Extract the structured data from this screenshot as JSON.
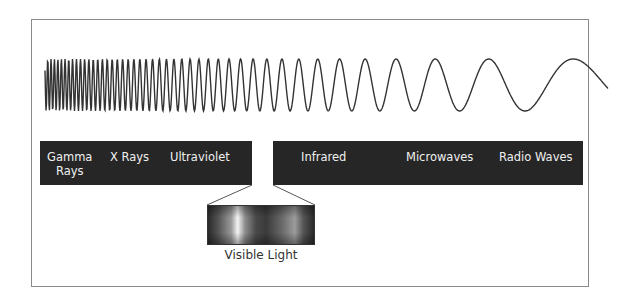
{
  "diagram": {
    "bands": [
      {
        "id": "gamma",
        "label_line1": "Gamma",
        "label_line2": "Rays"
      },
      {
        "id": "xray",
        "label": "X Rays"
      },
      {
        "id": "uv",
        "label": "Ultraviolet"
      },
      {
        "id": "visible",
        "label": ""
      },
      {
        "id": "infrared",
        "label": "Infrared"
      },
      {
        "id": "microwave",
        "label": "Microwaves"
      },
      {
        "id": "radio",
        "label": "Radio Waves"
      }
    ],
    "visible_light_label": "Visible Light",
    "colors": {
      "bar": "#262626",
      "bar_text": "#f0f0f0",
      "wave": "#333333",
      "frame": "#8a8a8a"
    }
  }
}
